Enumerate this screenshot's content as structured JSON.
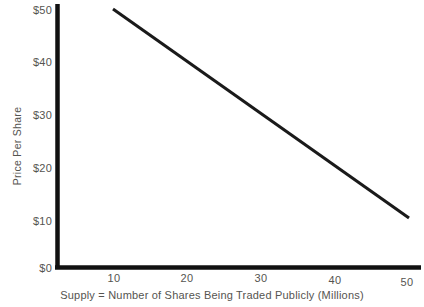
{
  "chart_data": {
    "type": "line",
    "title": "",
    "subtitle": "",
    "xlabel": "Supply = Number of Shares Being Traded Publicly (Millions)",
    "ylabel": "Price Per Share",
    "x": [
      10,
      50
    ],
    "xlim": [
      0,
      55
    ],
    "ylim": [
      0,
      50
    ],
    "xticks": [
      10,
      20,
      30,
      40,
      50
    ],
    "yticks": [
      0,
      10,
      20,
      30,
      40,
      50
    ],
    "xtick_labels": [
      "10",
      "20",
      "30",
      "40",
      "50"
    ],
    "ytick_labels": [
      "$0",
      "$10",
      "$20",
      "$30",
      "$40",
      "$50"
    ],
    "grid": false,
    "legend": false,
    "legend_position": "none",
    "series": [
      {
        "name": "Supply",
        "x": [
          10,
          50
        ],
        "values": [
          50,
          10
        ],
        "color": "#1a1a1a",
        "line_width": 3,
        "annotation": ""
      }
    ],
    "axis_color": "#111111",
    "text_color": "#555450",
    "background": "#ffffff"
  },
  "axes": {
    "y_title": "Price Per Share",
    "x_title": "Supply = Number of Shares Being Traded Publicly (Millions)",
    "y_ticks": [
      {
        "label": "$50",
        "value": 50
      },
      {
        "label": "$40",
        "value": 40
      },
      {
        "label": "$30",
        "value": 30
      },
      {
        "label": "$20",
        "value": 20
      },
      {
        "label": "$10",
        "value": 10
      },
      {
        "label": "$0",
        "value": 0
      }
    ],
    "x_ticks": [
      {
        "label": "10",
        "value": 10
      },
      {
        "label": "20",
        "value": 20
      },
      {
        "label": "30",
        "value": 30
      },
      {
        "label": "40",
        "value": 40
      },
      {
        "label": "50",
        "value": 50
      }
    ]
  }
}
